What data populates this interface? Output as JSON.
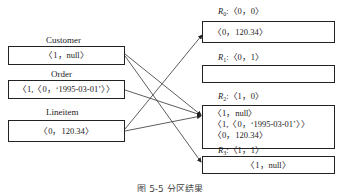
{
  "left_tables": [
    {
      "name": "Customer",
      "tuple": "〈1，null〉"
    },
    {
      "name": "Order",
      "tuple": "〈1,〈0，‘1995-03-01’〉〉"
    },
    {
      "name": "Lineitem",
      "tuple": "〈0，120.34〉"
    }
  ],
  "partitions": [
    {
      "label": "R",
      "sub": "0",
      "key": ":〈0，0〉",
      "tuples": [
        "〈0，120.34〉"
      ]
    },
    {
      "label": "R",
      "sub": "1",
      "key": ":〈0，1〉",
      "tuples": []
    },
    {
      "label": "R",
      "sub": "2",
      "key": ":〈1，0〉",
      "tuples": [
        "〈1，null〉",
        "〈1,〈0，‘1995-03-01’〉〉",
        "〈0，120.34〉"
      ]
    },
    {
      "label": "R",
      "sub": "3",
      "key": ":〈1，1〉",
      "tuples": [
        "〈1，null〉"
      ]
    }
  ],
  "edges": [
    {
      "from": "Customer",
      "to": "R2"
    },
    {
      "from": "Customer",
      "to": "R3"
    },
    {
      "from": "Order",
      "to": "R2"
    },
    {
      "from": "Lineitem",
      "to": "R0"
    },
    {
      "from": "Lineitem",
      "to": "R2"
    }
  ],
  "caption": "图 5-5  分区结果",
  "colors": {
    "line": "#222222",
    "text": "#1a1a1a"
  }
}
